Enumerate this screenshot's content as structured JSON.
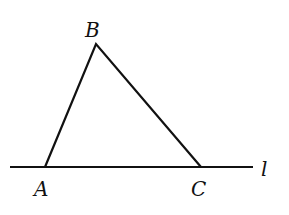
{
  "diagram": {
    "type": "geometry",
    "line": {
      "label": "l",
      "x1": 10,
      "y1": 167,
      "x2": 253,
      "y2": 167
    },
    "points": [
      {
        "label": "A",
        "x": 45,
        "y": 167,
        "label_x": 34,
        "label_y": 196
      },
      {
        "label": "B",
        "x": 96,
        "y": 44,
        "label_x": 85,
        "label_y": 36
      },
      {
        "label": "C",
        "x": 201,
        "y": 167,
        "label_x": 191,
        "label_y": 196
      }
    ],
    "line_label_pos": {
      "x": 260,
      "y": 176
    },
    "stroke_color": "#111111"
  }
}
